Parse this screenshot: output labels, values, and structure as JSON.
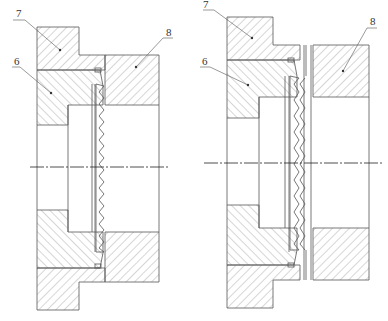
{
  "diagram": {
    "type": "mechanical-cross-section",
    "views": [
      {
        "id": "left",
        "description": "assembled state",
        "labels": [
          {
            "text": "7",
            "part": "upper flange"
          },
          {
            "text": "6",
            "part": "inner housing"
          },
          {
            "text": "8",
            "part": "outer housing"
          }
        ]
      },
      {
        "id": "right",
        "description": "separated state",
        "labels": [
          {
            "text": "7",
            "part": "upper flange"
          },
          {
            "text": "6",
            "part": "inner housing"
          },
          {
            "text": "8",
            "part": "outer housing"
          }
        ]
      }
    ]
  },
  "colors": {
    "line": "#555555",
    "hatch": "#888888",
    "background": "#ffffff"
  }
}
